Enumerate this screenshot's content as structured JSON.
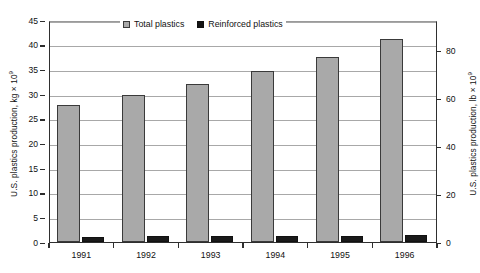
{
  "chart_data": {
    "type": "bar",
    "title": "",
    "xlabel": "",
    "ylabel": "U.S. plastics production, kg × 10",
    "ylabel_exponent": "9",
    "ylabel_right": "U.S. plastics production, lb × 10",
    "ylabel_right_exponent": "9",
    "categories": [
      "1991",
      "1992",
      "1993",
      "1994",
      "1995",
      "1996"
    ],
    "series": [
      {
        "name": "Total plastics",
        "color": "#a9a9a9",
        "values": [
          27.7,
          29.8,
          32.0,
          34.7,
          37.5,
          41.2
        ]
      },
      {
        "name": "Reinforced plastics",
        "color": "#1a1a1a",
        "values": [
          1.05,
          1.25,
          1.2,
          1.3,
          1.25,
          1.35
        ]
      }
    ],
    "ylim": [
      0,
      45
    ],
    "yticks": [
      "0",
      "5",
      "10",
      "15",
      "20",
      "25",
      "30",
      "35",
      "40",
      "45"
    ],
    "ytick_values": [
      0,
      5,
      10,
      15,
      20,
      25,
      30,
      35,
      40,
      45
    ],
    "ylim_right": [
      0,
      92.59
    ],
    "yticks_right": [
      "0",
      "20",
      "40",
      "60",
      "80"
    ],
    "ytick_right_values": [
      0,
      20,
      40,
      60,
      80
    ],
    "grid": true,
    "legend_position": "top-center",
    "legend": [
      "Total plastics",
      "Reinforced plastics"
    ]
  },
  "legend": {
    "total_label": "Total plastics",
    "reinforced_label": "Reinforced plastics"
  }
}
